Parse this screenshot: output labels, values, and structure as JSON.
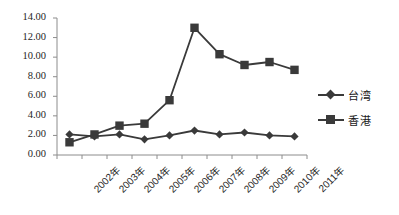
{
  "chart_data": {
    "type": "line",
    "title": "",
    "subtitle": "",
    "xlabel": "",
    "ylabel": "",
    "categories": [
      "2002年",
      "2003年",
      "2004年",
      "2005年",
      "2006年",
      "2007年",
      "2008年",
      "2009年",
      "2010年",
      "2011年"
    ],
    "series": [
      {
        "name": "台湾",
        "marker": "diamond",
        "color": "#3a3a3a",
        "values": [
          2.1,
          1.9,
          2.1,
          1.6,
          2.0,
          2.5,
          2.1,
          2.3,
          2.0,
          1.9
        ]
      },
      {
        "name": "香港",
        "marker": "square",
        "color": "#3a3a3a",
        "values": [
          1.3,
          2.1,
          3.0,
          3.2,
          5.6,
          13.0,
          10.3,
          9.2,
          9.5,
          8.7
        ]
      }
    ],
    "ylim": [
      0.0,
      14.0
    ],
    "ytick_values": [
      0.0,
      2.0,
      4.0,
      6.0,
      8.0,
      10.0,
      12.0,
      14.0
    ],
    "ytick_labels": [
      "0.00",
      "2.00",
      "4.00",
      "6.00",
      "8.00",
      "10.00",
      "12.00",
      "14.00"
    ],
    "grid": false,
    "legend_position": "right"
  }
}
